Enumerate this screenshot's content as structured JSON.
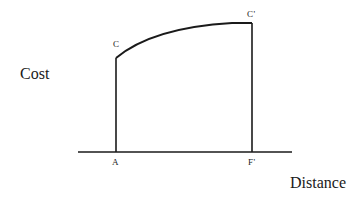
{
  "diagram": {
    "y_axis_label": "Cost",
    "x_axis_label": "Distance",
    "points": {
      "C": "C",
      "C_prime": "C'",
      "A": "A",
      "F_prime": "F'"
    },
    "colors": {
      "line": "#1a1a1a",
      "background": "#ffffff"
    },
    "geometry": {
      "baseline": {
        "x1": 78,
        "x2": 292,
        "y": 152
      },
      "left_vertical": {
        "x": 116,
        "y_top": 58,
        "y_bottom": 152
      },
      "right_vertical": {
        "x": 252,
        "y_top": 23,
        "y_bottom": 152
      },
      "curve": {
        "from": [
          116,
          58
        ],
        "control": [
          170,
          22
        ],
        "to": [
          252,
          23
        ]
      }
    }
  }
}
